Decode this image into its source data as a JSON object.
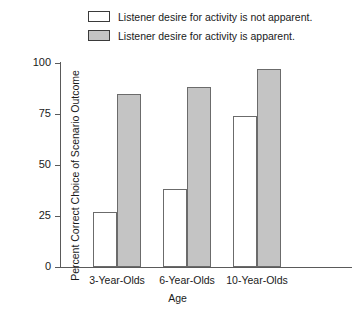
{
  "chart_data": {
    "type": "bar",
    "title": "",
    "xlabel": "Age",
    "ylabel": "Percent Correct Choice of Scenario Outcome",
    "categories": [
      "3-Year-Olds",
      "6-Year-Olds",
      "10-Year-Olds"
    ],
    "series": [
      {
        "name": "Listener desire for activity is not apparent.",
        "values": [
          27,
          38,
          74
        ],
        "fill": "#ffffff",
        "edge": "#6b6b6b"
      },
      {
        "name": "Listener desire for activity is apparent.",
        "values": [
          85,
          88,
          97
        ],
        "fill": "#c4c4c4",
        "edge": "#6b6b6b"
      }
    ],
    "ylim": [
      0,
      100
    ],
    "yticks": [
      0,
      25,
      50,
      75,
      100
    ],
    "ytick_labels": [
      "0",
      "25",
      "50",
      "75",
      "100"
    ],
    "grid": false,
    "legend_position": "above-plot"
  },
  "legend": {
    "items": [
      {
        "swatch": "open-square-swatch",
        "label": "Listener desire for activity is not apparent."
      },
      {
        "swatch": "filled-gray-square-swatch",
        "label": "Listener desire for activity is apparent."
      }
    ]
  },
  "axes": {
    "y_title": "Percent Correct Choice of Scenario Outcome",
    "x_title": "Age",
    "y_tick_labels": [
      "100",
      "75",
      "50",
      "25",
      "0"
    ],
    "x_tick_labels": [
      "3-Year-Olds",
      "6-Year-Olds",
      "10-Year-Olds"
    ]
  },
  "colors": {
    "bar_open_fill": "#ffffff",
    "bar_filled_fill": "#c4c4c4",
    "bar_edge": "#6b6b6b",
    "axis": "#5a5a5a",
    "text": "#1a1a1a",
    "background": "#ffffff"
  }
}
